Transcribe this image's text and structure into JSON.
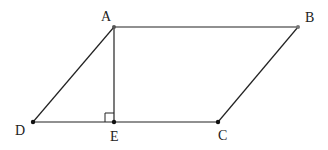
{
  "diagram": {
    "type": "parallelogram",
    "stroke_color": "#222222",
    "points": {
      "A": {
        "label": "A",
        "x": 114,
        "y": 27
      },
      "B": {
        "label": "B",
        "x": 298,
        "y": 27
      },
      "C": {
        "label": "C",
        "x": 218,
        "y": 122
      },
      "D": {
        "label": "D",
        "x": 33,
        "y": 122
      },
      "E": {
        "label": "E",
        "x": 114,
        "y": 122
      }
    },
    "segments": [
      "AB",
      "BC",
      "CD",
      "DA",
      "AE"
    ],
    "right_angle_at": "E"
  }
}
